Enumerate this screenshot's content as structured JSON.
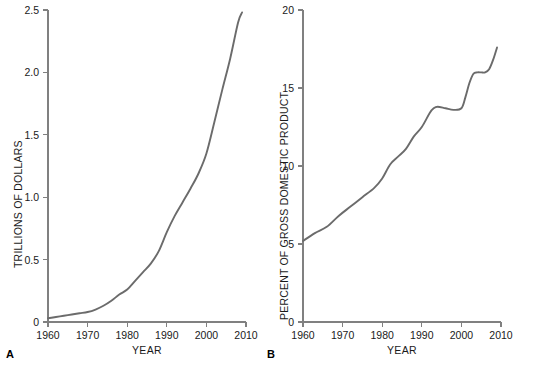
{
  "figure": {
    "background_color": "#ffffff",
    "line_color": "#6b6b6b",
    "axis_color": "#808080"
  },
  "panels": {
    "a": {
      "tag": "A",
      "xlabel": "YEAR",
      "ylabel": "TRILLIONS OF DOLLARS",
      "xticks": [
        "1960",
        "1970",
        "1980",
        "1990",
        "2000",
        "2010"
      ],
      "yticks": [
        "0",
        "0.5",
        "1.0",
        "1.5",
        "2.0",
        "2.5"
      ]
    },
    "b": {
      "tag": "B",
      "xlabel": "YEAR",
      "ylabel": "PERCENT OF GROSS DOMESTIC PRODUCT",
      "xticks": [
        "1960",
        "1970",
        "1980",
        "1990",
        "2000",
        "2010"
      ],
      "yticks": [
        "0",
        "5",
        "10",
        "15",
        "20"
      ]
    }
  },
  "chart_data": [
    {
      "type": "line",
      "panel": "A",
      "title": "",
      "xlabel": "YEAR",
      "ylabel": "TRILLIONS OF DOLLARS",
      "xlim": [
        1960,
        2010
      ],
      "ylim": [
        0,
        2.5
      ],
      "xticks": [
        1960,
        1970,
        1980,
        1990,
        2000,
        2010
      ],
      "yticks": [
        0,
        0.5,
        1.0,
        1.5,
        2.0,
        2.5
      ],
      "grid": false,
      "legend": null,
      "series": [
        {
          "name": "National health expenditures",
          "color": "#6b6b6b",
          "x": [
            1960,
            1962,
            1964,
            1966,
            1968,
            1970,
            1972,
            1974,
            1976,
            1978,
            1980,
            1982,
            1984,
            1986,
            1988,
            1990,
            1992,
            1994,
            1996,
            1998,
            2000,
            2002,
            2004,
            2006,
            2008,
            2009
          ],
          "y": [
            0.03,
            0.04,
            0.05,
            0.06,
            0.07,
            0.08,
            0.1,
            0.13,
            0.17,
            0.22,
            0.26,
            0.33,
            0.4,
            0.47,
            0.57,
            0.72,
            0.85,
            0.96,
            1.07,
            1.19,
            1.35,
            1.6,
            1.86,
            2.11,
            2.4,
            2.48
          ]
        }
      ]
    },
    {
      "type": "line",
      "panel": "B",
      "title": "",
      "xlabel": "YEAR",
      "ylabel": "PERCENT OF GROSS DOMESTIC PRODUCT",
      "xlim": [
        1960,
        2010
      ],
      "ylim": [
        0,
        20
      ],
      "xticks": [
        1960,
        1970,
        1980,
        1990,
        2000,
        2010
      ],
      "yticks": [
        0,
        5,
        10,
        15,
        20
      ],
      "grid": false,
      "legend": null,
      "series": [
        {
          "name": "Health expenditures as share of GDP",
          "color": "#6b6b6b",
          "x": [
            1960,
            1963,
            1966,
            1969,
            1972,
            1975,
            1978,
            1980,
            1982,
            1984,
            1986,
            1988,
            1990,
            1992,
            1993,
            1994,
            1996,
            1998,
            2000,
            2001,
            2002,
            2003,
            2004,
            2005,
            2006,
            2007,
            2008,
            2009
          ],
          "y": [
            5.2,
            5.7,
            6.1,
            6.8,
            7.4,
            8.0,
            8.6,
            9.2,
            10.1,
            10.6,
            11.1,
            11.9,
            12.5,
            13.4,
            13.7,
            13.8,
            13.7,
            13.6,
            13.7,
            14.4,
            15.3,
            15.9,
            16.0,
            16.0,
            16.0,
            16.2,
            16.8,
            17.6
          ]
        }
      ]
    }
  ]
}
